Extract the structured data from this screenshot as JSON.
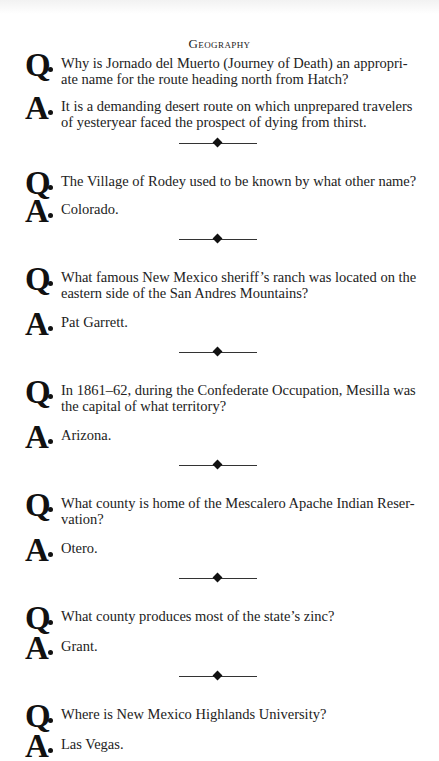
{
  "page": {
    "heading": "Geography",
    "q_marker": "Q",
    "a_marker": "A",
    "items": [
      {
        "question": "Why is Jornado del Muerto (Journey of Death) an appropri- ate name for the route heading north from Hatch?",
        "answer": "It is a demanding desert route on which unprepared travelers of yesteryear faced the prospect of dying from thirst."
      },
      {
        "question": "The Village of Rodey used to be known by what other name?",
        "answer": "Colorado."
      },
      {
        "question": "What famous New Mexico sheriff’s ranch was located on the eastern side of the San Andres Mountains?",
        "answer": "Pat Garrett."
      },
      {
        "question": "In 1861–62, during the Confederate Occupation, Mesilla was the capital of what territory?",
        "answer": "Arizona."
      },
      {
        "question": "What county is home of the Mescalero Apache Indian Reser- vation?",
        "answer": "Otero."
      },
      {
        "question": "What county produces most of the state’s zinc?",
        "answer": "Grant."
      },
      {
        "question": "Where is New Mexico Highlands University?",
        "answer": "Las Vegas."
      }
    ]
  }
}
